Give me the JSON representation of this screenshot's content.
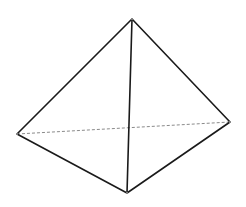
{
  "diagram": {
    "type": "tetrahedron",
    "colors": {
      "background": "#ffffff",
      "solid_edge": "#1a1a1a",
      "hidden_edge": "#8a8a8a"
    },
    "vertices": {
      "top": [
        132,
        19
      ],
      "left": [
        17,
        134
      ],
      "right": [
        230,
        122
      ],
      "bottom": [
        127,
        193
      ]
    },
    "edges": [
      {
        "from": "top",
        "to": "left",
        "style": "solid"
      },
      {
        "from": "top",
        "to": "right",
        "style": "solid"
      },
      {
        "from": "top",
        "to": "bottom",
        "style": "solid"
      },
      {
        "from": "left",
        "to": "bottom",
        "style": "solid"
      },
      {
        "from": "right",
        "to": "bottom",
        "style": "solid"
      },
      {
        "from": "left",
        "to": "right",
        "style": "dashed"
      }
    ]
  }
}
